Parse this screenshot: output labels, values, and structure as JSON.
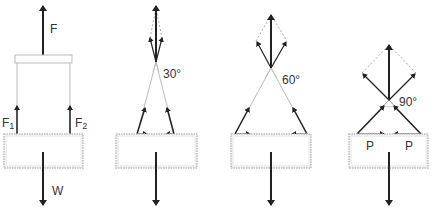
{
  "figure": {
    "panel1": {
      "label_F": "F",
      "label_F1_main": "F",
      "label_F1_sub": "1",
      "label_F2_main": "F",
      "label_F2_sub": "2",
      "label_W": "W"
    },
    "panel2": {
      "angle_label": "30°"
    },
    "panel3": {
      "angle_label": "60°"
    },
    "panel4": {
      "angle_label": "90°",
      "label_P_left": "P",
      "label_P_right": "P"
    }
  },
  "colors": {
    "arrow": "#222222",
    "string": "#bbbbbb",
    "dashed": "#aaaaaa",
    "box_border": "#bdbdbd"
  }
}
